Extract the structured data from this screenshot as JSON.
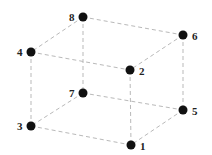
{
  "diagram": {
    "type": "cube-graph",
    "edge_style": "dashed",
    "colors": {
      "edge": "#b9b9b9",
      "node": "#111111",
      "label": "#222222",
      "background": "#ffffff"
    },
    "nodes": [
      {
        "id": "1",
        "label": "1",
        "x": 131,
        "y": 145,
        "label_dx": 9,
        "label_dy": 5
      },
      {
        "id": "2",
        "label": "2",
        "x": 130,
        "y": 70,
        "label_dx": 9,
        "label_dy": 5
      },
      {
        "id": "3",
        "label": "3",
        "x": 31,
        "y": 126,
        "label_dx": -14,
        "label_dy": 4
      },
      {
        "id": "4",
        "label": "4",
        "x": 31,
        "y": 52,
        "label_dx": -14,
        "label_dy": 4
      },
      {
        "id": "5",
        "label": "5",
        "x": 183,
        "y": 110,
        "label_dx": 9,
        "label_dy": 5
      },
      {
        "id": "6",
        "label": "6",
        "x": 183,
        "y": 35,
        "label_dx": 9,
        "label_dy": 5
      },
      {
        "id": "7",
        "label": "7",
        "x": 83,
        "y": 93,
        "label_dx": -14,
        "label_dy": 4
      },
      {
        "id": "8",
        "label": "8",
        "x": 83,
        "y": 17,
        "label_dx": -14,
        "label_dy": 4
      }
    ],
    "edges": [
      [
        "8",
        "6"
      ],
      [
        "8",
        "4"
      ],
      [
        "8",
        "7"
      ],
      [
        "4",
        "2"
      ],
      [
        "4",
        "3"
      ],
      [
        "6",
        "2"
      ],
      [
        "6",
        "5"
      ],
      [
        "2",
        "1"
      ],
      [
        "7",
        "3"
      ],
      [
        "7",
        "5"
      ],
      [
        "3",
        "1"
      ],
      [
        "5",
        "1"
      ]
    ]
  }
}
